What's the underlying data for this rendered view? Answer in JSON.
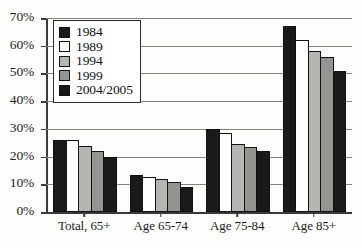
{
  "chart_data": {
    "type": "bar",
    "title": "",
    "xlabel": "",
    "ylabel": "",
    "ylim": [
      0,
      70
    ],
    "ytick_labels": [
      "70%",
      "60%",
      "50%",
      "40%",
      "30%",
      "20%",
      "10%",
      "0%"
    ],
    "ytick_values": [
      70,
      60,
      50,
      40,
      30,
      20,
      10,
      0
    ],
    "grid": true,
    "legend_position": "top-left",
    "categories": [
      "Total, 65+",
      "Age 65-74",
      "Age 75-84",
      "Age 85+"
    ],
    "series": [
      {
        "name": "1984",
        "color": "#1a1a1a",
        "values": [
          26,
          13.5,
          30,
          67
        ]
      },
      {
        "name": "1989",
        "color": "#ffffff",
        "values": [
          26,
          12.5,
          28.5,
          62
        ]
      },
      {
        "name": "1994",
        "color": "#b5b5b2",
        "values": [
          24,
          12,
          24.5,
          58
        ]
      },
      {
        "name": "1999",
        "color": "#949490",
        "values": [
          22,
          11,
          23.5,
          56
        ]
      },
      {
        "name": "2004/2005",
        "color": "#1a1a1a",
        "values": [
          20,
          9,
          22,
          51
        ]
      }
    ]
  }
}
